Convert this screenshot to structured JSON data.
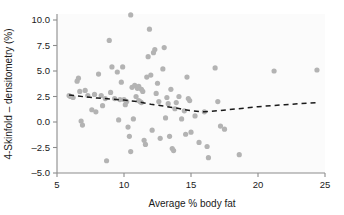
{
  "chart_data": {
    "type": "scatter",
    "title": "",
    "xlabel": "Average % body fat",
    "ylabel": "4-Skinfold – densitometry (%)",
    "xlim": [
      5,
      25
    ],
    "ylim": [
      -5.0,
      10.0
    ],
    "grid": false,
    "legend": "none",
    "xticks": [
      5,
      10,
      15,
      20,
      25
    ],
    "xtick_labels": [
      "5",
      "10",
      "15",
      "20",
      "25"
    ],
    "yticks": [
      -5.0,
      -2.5,
      0.0,
      2.5,
      5.0,
      7.5,
      10.0
    ],
    "ytick_labels": [
      "-5.0",
      "-2.5",
      "0.0",
      "2.5",
      "5.0",
      "7.5",
      "10.0"
    ],
    "point_color": "#b3b3b3",
    "point_radius": 2.6,
    "trend_color": "#1a1a1a",
    "trend_style": "dashed",
    "points": [
      [
        5.9,
        2.6
      ],
      [
        6.0,
        2.5
      ],
      [
        6.2,
        2.4
      ],
      [
        6.5,
        4.0
      ],
      [
        6.6,
        4.3
      ],
      [
        6.7,
        3.0
      ],
      [
        6.8,
        0.1
      ],
      [
        6.9,
        -0.3
      ],
      [
        7.1,
        3.1
      ],
      [
        7.3,
        2.6
      ],
      [
        7.6,
        1.2
      ],
      [
        7.8,
        2.7
      ],
      [
        7.9,
        1.0
      ],
      [
        8.1,
        4.7
      ],
      [
        8.3,
        2.6
      ],
      [
        8.4,
        1.6
      ],
      [
        8.6,
        2.3
      ],
      [
        8.7,
        -3.8
      ],
      [
        8.9,
        8.0
      ],
      [
        9.0,
        2.9
      ],
      [
        9.1,
        5.4
      ],
      [
        9.3,
        2.3
      ],
      [
        9.5,
        4.9
      ],
      [
        9.6,
        0.2
      ],
      [
        9.7,
        2.2
      ],
      [
        9.8,
        3.9
      ],
      [
        9.9,
        5.4
      ],
      [
        10.0,
        2.2
      ],
      [
        10.1,
        1.7
      ],
      [
        10.2,
        2.0
      ],
      [
        10.3,
        -0.5
      ],
      [
        10.4,
        -1.4
      ],
      [
        10.5,
        -2.9
      ],
      [
        10.5,
        10.5
      ],
      [
        10.6,
        3.4
      ],
      [
        10.7,
        0.3
      ],
      [
        10.8,
        3.6
      ],
      [
        10.9,
        2.5
      ],
      [
        11.0,
        3.3
      ],
      [
        11.1,
        2.1
      ],
      [
        11.1,
        3.5
      ],
      [
        11.2,
        2.0
      ],
      [
        11.3,
        3.2
      ],
      [
        11.3,
        1.9
      ],
      [
        11.4,
        3.0
      ],
      [
        11.5,
        -1.8
      ],
      [
        11.6,
        -2.2
      ],
      [
        11.7,
        4.4
      ],
      [
        11.8,
        6.4
      ],
      [
        11.9,
        9.1
      ],
      [
        12.0,
        4.6
      ],
      [
        12.1,
        -0.8
      ],
      [
        12.2,
        6.8
      ],
      [
        12.3,
        7.1
      ],
      [
        12.4,
        2.8
      ],
      [
        12.5,
        3.8
      ],
      [
        12.6,
        2.0
      ],
      [
        12.7,
        -1.6
      ],
      [
        12.9,
        5.2
      ],
      [
        13.0,
        7.3
      ],
      [
        13.1,
        0.4
      ],
      [
        13.2,
        2.4
      ],
      [
        13.3,
        1.8
      ],
      [
        13.4,
        -1.4
      ],
      [
        13.5,
        3.2
      ],
      [
        13.6,
        -2.6
      ],
      [
        13.7,
        -2.8
      ],
      [
        13.8,
        1.3
      ],
      [
        13.9,
        1.9
      ],
      [
        14.1,
        2.5
      ],
      [
        14.3,
        0.3
      ],
      [
        14.5,
        1.1
      ],
      [
        14.6,
        -1.2
      ],
      [
        14.7,
        4.4
      ],
      [
        14.8,
        2.3
      ],
      [
        14.9,
        2.1
      ],
      [
        15.0,
        -1.0
      ],
      [
        15.3,
        0.6
      ],
      [
        15.6,
        -2.0
      ],
      [
        16.0,
        1.0
      ],
      [
        16.2,
        -2.4
      ],
      [
        16.3,
        -3.5
      ],
      [
        16.8,
        5.3
      ],
      [
        17.0,
        2.0
      ],
      [
        17.2,
        -0.4
      ],
      [
        17.5,
        -0.7
      ],
      [
        18.6,
        -3.2
      ],
      [
        21.2,
        5.0
      ],
      [
        24.4,
        5.1
      ]
    ],
    "trend_line": [
      [
        5.9,
        2.65
      ],
      [
        6.5,
        2.55
      ],
      [
        7.2,
        2.45
      ],
      [
        8.0,
        2.35
      ],
      [
        9.0,
        2.25
      ],
      [
        10.0,
        2.15
      ],
      [
        11.0,
        2.0
      ],
      [
        12.0,
        1.75
      ],
      [
        13.0,
        1.55
      ],
      [
        14.0,
        1.35
      ],
      [
        15.0,
        1.1
      ],
      [
        16.0,
        1.0
      ],
      [
        17.0,
        1.1
      ],
      [
        18.5,
        1.3
      ],
      [
        20.0,
        1.5
      ],
      [
        22.0,
        1.7
      ],
      [
        24.4,
        1.9
      ]
    ]
  }
}
